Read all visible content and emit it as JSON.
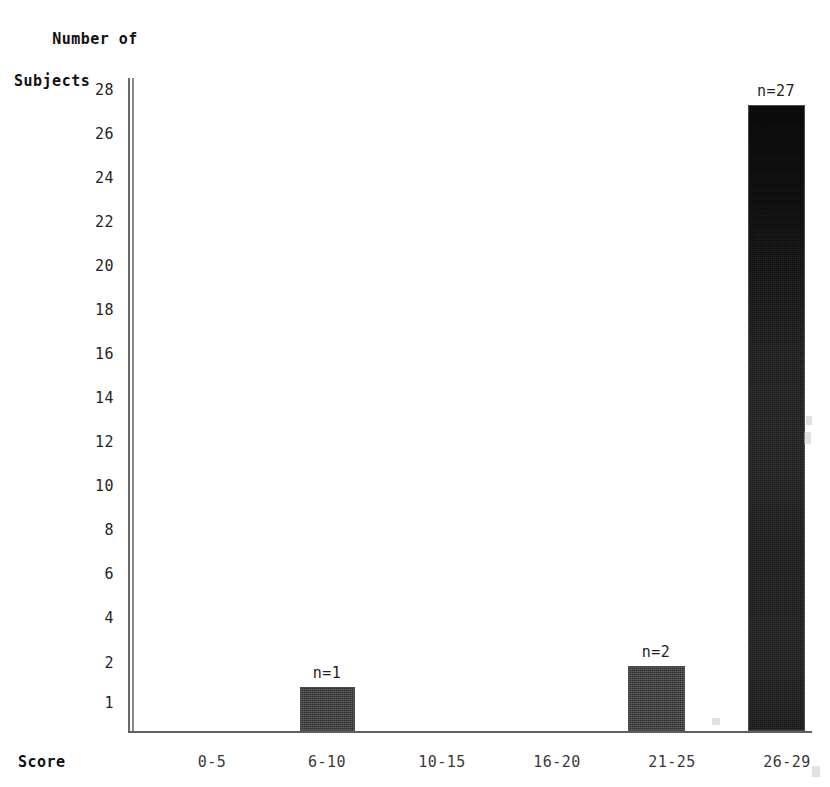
{
  "chart_data": {
    "type": "bar",
    "title": "",
    "ylabel": "Number of\nSubjects",
    "ylabel_lines": [
      "Number of",
      "Subjects"
    ],
    "xlabel": "Score",
    "categories": [
      "0-5",
      "6-10",
      "10-15",
      "16-20",
      "21-25",
      "26-29"
    ],
    "values": [
      0,
      1,
      0,
      0,
      2,
      27
    ],
    "data_labels": [
      "",
      "n=1",
      "",
      "",
      "n=2",
      "n=27"
    ],
    "ytick_labels": [
      "28",
      "26",
      "24",
      "22",
      "20",
      "18",
      "16",
      "14",
      "12",
      "10",
      "8",
      "6",
      "4",
      "2",
      "1"
    ],
    "ytick_values": [
      28,
      26,
      24,
      22,
      20,
      18,
      16,
      14,
      12,
      10,
      8,
      6,
      4,
      2,
      1
    ],
    "ylim": [
      0,
      28
    ],
    "grid": false,
    "legend": null,
    "bar_color": "#3b3b3b",
    "axis_color": "#5f5f5f",
    "text_color": "#1a1a1a"
  },
  "axes": {
    "y_title_line1": "Number of",
    "y_title_line2": "Subjects",
    "x_title": "Score"
  },
  "yticks": [
    {
      "label": "28",
      "top": 82
    },
    {
      "label": "26",
      "top": 126
    },
    {
      "label": "24",
      "top": 170
    },
    {
      "label": "22",
      "top": 214
    },
    {
      "label": "20",
      "top": 258
    },
    {
      "label": "18",
      "top": 302
    },
    {
      "label": "16",
      "top": 346
    },
    {
      "label": "14",
      "top": 390
    },
    {
      "label": "12",
      "top": 434
    },
    {
      "label": "10",
      "top": 478
    },
    {
      "label": "8",
      "top": 522
    },
    {
      "label": "6",
      "top": 566
    },
    {
      "label": "4",
      "top": 610
    },
    {
      "label": "2",
      "top": 655
    },
    {
      "label": "1",
      "top": 695
    }
  ],
  "xticks": [
    {
      "label": "0-5",
      "left": 167
    },
    {
      "label": "6-10",
      "left": 282
    },
    {
      "label": "10-15",
      "left": 397
    },
    {
      "label": "16-20",
      "left": 512
    },
    {
      "label": "21-25",
      "left": 627
    },
    {
      "label": "26-29",
      "left": 742
    }
  ],
  "bars": [
    {
      "category": "6-10",
      "value": 1,
      "label": "n=1",
      "left": 300,
      "top": 687,
      "width": 55,
      "height": 44,
      "style": "dark",
      "label_left": 282,
      "label_top": 664
    },
    {
      "category": "21-25",
      "value": 2,
      "label": "n=2",
      "left": 628,
      "top": 666,
      "width": 57,
      "height": 65,
      "style": "dark",
      "label_left": 611,
      "label_top": 643
    },
    {
      "category": "26-29",
      "value": 27,
      "label": "n=27",
      "left": 748,
      "top": 105,
      "width": 57,
      "height": 626,
      "style": "tall",
      "label_left": 731,
      "label_top": 82
    }
  ]
}
